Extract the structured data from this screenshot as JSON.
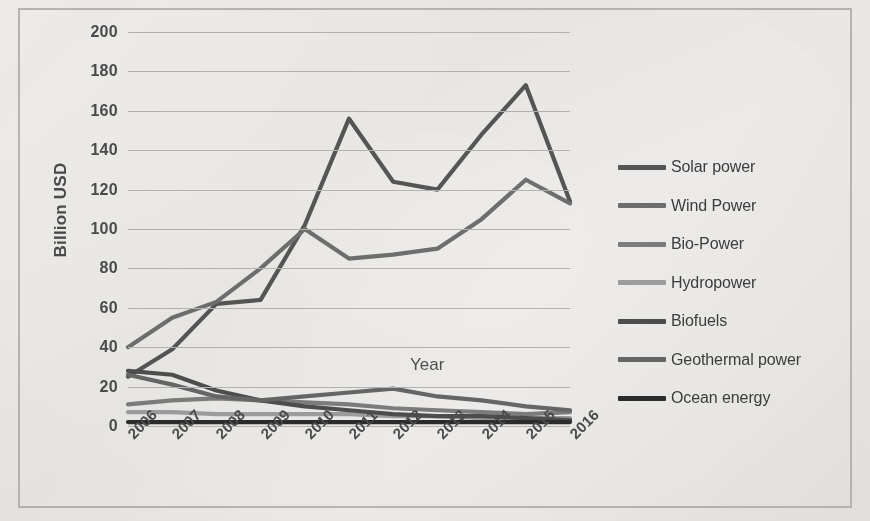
{
  "chart_data": {
    "type": "line",
    "title": "",
    "xlabel": "Year",
    "ylabel": "Billion USD",
    "categories": [
      "2006",
      "2007",
      "2008",
      "2009",
      "2010",
      "2011",
      "2012",
      "2013",
      "2014",
      "2015",
      "2016"
    ],
    "ylim": [
      0,
      200
    ],
    "ytick_labels": [
      "200",
      "180",
      "160",
      "140",
      "120",
      "100",
      "80",
      "60",
      "40",
      "20",
      "0"
    ],
    "ytick_values": [
      200,
      180,
      160,
      140,
      120,
      100,
      80,
      60,
      40,
      20,
      0
    ],
    "grid": true,
    "legend_position": "right",
    "series": [
      {
        "name": "Solar power",
        "color": "#555555",
        "values": [
          25,
          39,
          62,
          64,
          102,
          156,
          124,
          120,
          148,
          173,
          114
        ]
      },
      {
        "name": "Wind Power",
        "color": "#6e6e6e",
        "values": [
          40,
          55,
          63,
          80,
          100,
          85,
          87,
          90,
          105,
          125,
          113
        ]
      },
      {
        "name": "Bio-Power",
        "color": "#7d7d7d",
        "values": [
          11,
          13,
          14,
          13,
          12,
          11,
          9,
          8,
          7,
          6,
          7
        ]
      },
      {
        "name": "Hydropower",
        "color": "#9e9e9e",
        "values": [
          7,
          7,
          6,
          6,
          6,
          6,
          5,
          5,
          4,
          4,
          4
        ]
      },
      {
        "name": "Biofuels",
        "color": "#4e4e4e",
        "values": [
          28,
          26,
          18,
          13,
          10,
          8,
          6,
          5,
          5,
          4,
          3
        ]
      },
      {
        "name": "Geothermal power",
        "color": "#666666",
        "values": [
          26,
          21,
          15,
          13,
          15,
          17,
          19,
          15,
          13,
          10,
          8
        ]
      },
      {
        "name": "Ocean energy",
        "color": "#2b2b2b",
        "values": [
          2,
          2,
          2,
          2,
          2,
          2,
          2,
          2,
          2,
          2,
          2
        ]
      }
    ]
  },
  "axes": {
    "y_title": "Billion USD",
    "x_title": "Year"
  },
  "legend": {
    "items": [
      {
        "label": "Solar power"
      },
      {
        "label": "Wind Power"
      },
      {
        "label": "Bio-Power"
      },
      {
        "label": "Hydropower"
      },
      {
        "label": "Biofuels"
      },
      {
        "label": "Geothermal power"
      },
      {
        "label": "Ocean energy"
      }
    ]
  },
  "colors": {
    "background": "#efeeec",
    "frame": "#b9b7b4",
    "gridline": "#b5b3b1",
    "text": "#4c4c4c"
  }
}
